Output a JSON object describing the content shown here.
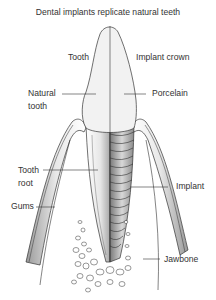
{
  "title": "Dental implants replicate natural teeth",
  "labels": {
    "tooth": "Tooth",
    "implant_crown": "Implant crown",
    "natural_tooth_1": "Natural",
    "natural_tooth_2": "tooth",
    "porcelain": "Porcelain",
    "tooth_root_1": "Tooth",
    "tooth_root_2": "root",
    "gums": "Gums",
    "implant": "Implant",
    "jawbone": "Jawbone"
  },
  "colors": {
    "line": "#333333",
    "fill_light": "#f2f2f2",
    "fill_shade": "#bdbdbd",
    "background": "#ffffff"
  }
}
